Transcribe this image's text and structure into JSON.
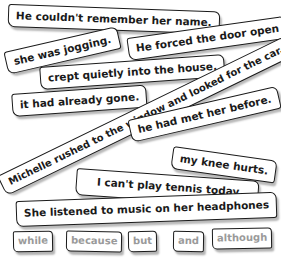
{
  "sentences": [
    {
      "id": "s1",
      "text": "He couldn't remember her name."
    },
    {
      "id": "s2",
      "text": "she was jogging."
    },
    {
      "id": "s3",
      "text": "He forced the door open"
    },
    {
      "id": "s4",
      "text": "crept quietly into the house."
    },
    {
      "id": "s5",
      "text": "it had already gone."
    },
    {
      "id": "s6",
      "text": "Michelle rushed to the window and looked for the car."
    },
    {
      "id": "s7",
      "text": "he had met her before."
    },
    {
      "id": "s8",
      "text": "my knee hurts."
    },
    {
      "id": "s9",
      "text": "I can't play tennis today"
    },
    {
      "id": "s10",
      "text": "She listened to music on her headphones"
    }
  ],
  "conjunctions": [
    "while",
    "because",
    "but",
    "and",
    "although"
  ],
  "colors": {
    "strip_text": "#1a1a1a",
    "conjunction_text": "#9a9a9a",
    "border": "#1a1a1a",
    "background": "#ffffff"
  }
}
